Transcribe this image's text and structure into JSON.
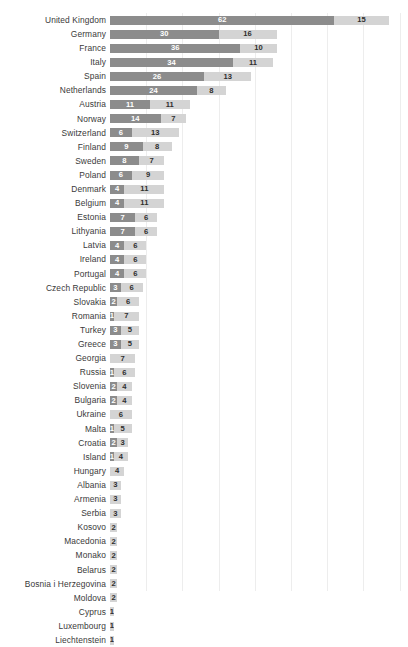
{
  "chart_data": {
    "type": "bar",
    "subtype": "stacked-horizontal-bar",
    "title": "",
    "subtitle": "",
    "xlabel": "",
    "ylabel": "",
    "xlim": [
      0,
      80
    ],
    "grid": true,
    "grid_interval": 10,
    "gridlines_at": [
      10,
      20,
      30,
      40,
      50,
      60,
      70,
      80
    ],
    "legend_position": "none",
    "orientation": "horizontal",
    "bar_colors": {
      "series_a": "#8c8c8c",
      "series_b": "#d4d4d4"
    },
    "value_label_colors": {
      "series_a": "#ffffff",
      "series_b": "#2e2e2e"
    },
    "categories": [
      "United Kingdom",
      "Germany",
      "France",
      "Italy",
      "Spain",
      "Netherlands",
      "Austria",
      "Norway",
      "Switzerland",
      "Finland",
      "Sweden",
      "Poland",
      "Denmark",
      "Belgium",
      "Estonia",
      "Lithyania",
      "Latvia",
      "Ireland",
      "Portugal",
      "Czech Republic",
      "Slovakia",
      "Romania",
      "Turkey",
      "Greece",
      "Georgia",
      "Russia",
      "Slovenia",
      "Bulgaria",
      "Ukraine",
      "Malta",
      "Croatia",
      "Island",
      "Hungary",
      "Albania",
      "Armenia",
      "Serbia",
      "Kosovo",
      "Macedonia",
      "Monako",
      "Belarus",
      "Bosnia i Herzegovina",
      "Moldova",
      "Cyprus",
      "Luxembourg",
      "Liechtenstein"
    ],
    "series": [
      {
        "name": "series_a",
        "values": [
          62,
          30,
          36,
          34,
          26,
          24,
          11,
          14,
          6,
          9,
          8,
          6,
          4,
          4,
          7,
          7,
          4,
          4,
          4,
          3,
          2,
          1,
          3,
          3,
          0,
          1,
          2,
          2,
          0,
          1,
          2,
          1,
          0,
          0,
          0,
          0,
          0,
          0,
          0,
          0,
          0,
          0,
          0,
          0,
          0
        ]
      },
      {
        "name": "series_b",
        "values": [
          15,
          16,
          10,
          11,
          13,
          8,
          11,
          7,
          13,
          8,
          7,
          9,
          11,
          11,
          6,
          6,
          6,
          6,
          6,
          6,
          6,
          7,
          5,
          5,
          7,
          6,
          4,
          4,
          6,
          5,
          3,
          4,
          4,
          3,
          3,
          3,
          2,
          2,
          2,
          2,
          2,
          2,
          1,
          1,
          1
        ]
      }
    ],
    "totals": [
      77,
      46,
      46,
      45,
      39,
      32,
      22,
      21,
      19,
      17,
      15,
      15,
      15,
      15,
      13,
      13,
      10,
      10,
      10,
      9,
      8,
      8,
      8,
      8,
      7,
      7,
      6,
      6,
      6,
      6,
      5,
      5,
      4,
      3,
      3,
      3,
      2,
      2,
      2,
      2,
      2,
      2,
      1,
      1,
      1
    ]
  },
  "caption": ""
}
